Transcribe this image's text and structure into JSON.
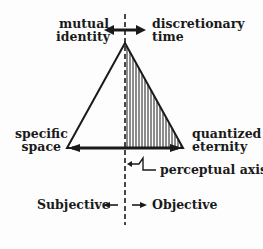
{
  "diagram": {
    "labels": {
      "top_left_line1": "mutual",
      "top_left_line2": "identity",
      "top_right_line1": "discretionary",
      "top_right_line2": "time",
      "left_line1": "specific",
      "left_line2": "space",
      "right_line1": "quantized",
      "right_line2": "eternity",
      "axis_label": "perceptual axis",
      "subjective": "Subjective",
      "objective": "Objective"
    },
    "colors": {
      "ink": "#1a1a1a",
      "background": "#fdfdfd"
    }
  }
}
